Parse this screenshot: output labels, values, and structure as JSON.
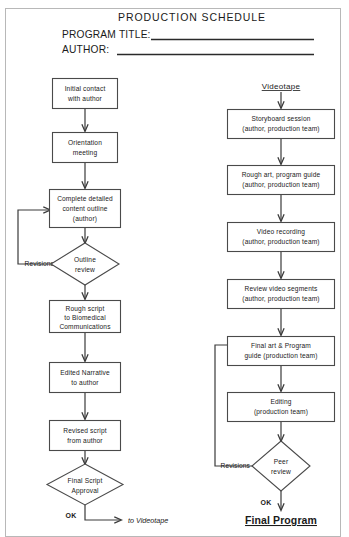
{
  "page": {
    "title": "PRODUCTION  SCHEDULE",
    "fields": [
      {
        "label": "PROGRAM TITLE:",
        "value": ""
      },
      {
        "label": "AUTHOR:",
        "value": ""
      }
    ]
  },
  "colors": {
    "box_stroke": "#4a4a4a",
    "line": "#3a3a3a",
    "text": "#1a1a1a",
    "page_border": "#b8b8b8",
    "background": "#ffffff"
  },
  "flowchart": {
    "type": "flowchart",
    "columns": [
      {
        "id": "script-column",
        "heading": "",
        "nodes": [
          {
            "id": "initial-contact",
            "shape": "process",
            "lines": [
              "Initial  contact",
              "with  author"
            ]
          },
          {
            "id": "orientation-meeting",
            "shape": "process",
            "lines": [
              "Orientation",
              "meeting"
            ]
          },
          {
            "id": "content-outline",
            "shape": "process",
            "lines": [
              "Complete detailed",
              "content outline",
              "(author)"
            ]
          },
          {
            "id": "outline-review",
            "shape": "decision",
            "lines": [
              "Outline",
              "review"
            ]
          },
          {
            "id": "rough-script",
            "shape": "process",
            "lines": [
              "Rough  script",
              "to  Biomedical",
              "Communications"
            ]
          },
          {
            "id": "edited-narrative",
            "shape": "process",
            "lines": [
              "Edited  Narrative",
              "to  author"
            ]
          },
          {
            "id": "revised-script",
            "shape": "process",
            "lines": [
              "Revised  script",
              "from  author"
            ]
          },
          {
            "id": "final-script-approval",
            "shape": "decision",
            "lines": [
              "Final   Script",
              "Approval"
            ]
          }
        ],
        "edge_labels": [
          {
            "id": "revisions-left",
            "text": "Revisions"
          },
          {
            "id": "ok-left",
            "text": "OK"
          }
        ],
        "terminal": {
          "id": "to-videotape",
          "text": "to  Videotape"
        }
      },
      {
        "id": "videotape-column",
        "heading": "Videotape",
        "nodes": [
          {
            "id": "storyboard-session",
            "shape": "process",
            "lines": [
              "Storyboard session",
              "(author, production team)"
            ]
          },
          {
            "id": "rough-art",
            "shape": "process",
            "lines": [
              "Rough art,  program guide",
              "(author, production team)"
            ]
          },
          {
            "id": "video-recording",
            "shape": "process",
            "lines": [
              "Video   recording",
              "(author, production team)"
            ]
          },
          {
            "id": "review-video-segments",
            "shape": "process",
            "lines": [
              "Review  video  segments",
              "(author, production team)"
            ]
          },
          {
            "id": "final-art",
            "shape": "process",
            "lines": [
              "Final art  &  Program",
              "guide   (production team)"
            ]
          },
          {
            "id": "editing",
            "shape": "process",
            "lines": [
              "Editing",
              "(production team)"
            ]
          },
          {
            "id": "peer-review",
            "shape": "decision",
            "lines": [
              "Peer",
              "review"
            ]
          }
        ],
        "edge_labels": [
          {
            "id": "revisions-right",
            "text": "Revisions"
          },
          {
            "id": "ok-right",
            "text": "OK"
          }
        ],
        "terminal": {
          "id": "final-program",
          "text": "Final Program"
        }
      }
    ]
  }
}
